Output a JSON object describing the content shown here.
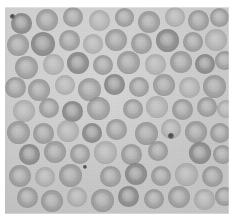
{
  "image": {
    "kind": "light-microscopy-photomicrograph",
    "subject": "red blood cells (erythrocytes) on a peripheral blood smear",
    "modality": "brightfield",
    "color_mode": "grayscale",
    "width_px": 234,
    "height_px": 224,
    "margin": {
      "paper_color": "#ffffff",
      "left_px": 5,
      "top_px": 7,
      "right_px": 5,
      "bottom_px": 10
    },
    "plate": {
      "left_px": 5,
      "top_px": 7,
      "width_px": 224,
      "height_px": 207,
      "background_color": "#c9c9c9",
      "background_label": "plasma / slide background"
    },
    "palette": {
      "background": "#c9c9c9",
      "background_light": "#cfcfcf",
      "background_dark": "#c2c2c2",
      "cell_rim": "#8e8e8e",
      "cell_body": "#a4a4a4",
      "cell_center_pallor": "#bdbdbd",
      "debris": "#4a4a4a",
      "paper": "#ffffff"
    },
    "cell_stats": {
      "count": 78,
      "mean_diameter_px": 20,
      "min_diameter_px": 15,
      "max_diameter_px": 25,
      "morphology": "biconcave discs with central pallor",
      "overlap_present": true
    },
    "debris_stats": {
      "count": 3,
      "description": "small dark punctate particles (platelet / stain precipitate)"
    }
  },
  "cells": [
    {
      "x": 6,
      "y": 6,
      "d": 21,
      "tone": "dark"
    },
    {
      "x": 31,
      "y": 2,
      "d": 22,
      "tone": "normal"
    },
    {
      "x": 58,
      "y": 0,
      "d": 20,
      "tone": "normal"
    },
    {
      "x": 84,
      "y": 3,
      "d": 21,
      "tone": "pale"
    },
    {
      "x": 110,
      "y": 1,
      "d": 19,
      "tone": "normal"
    },
    {
      "x": 133,
      "y": 4,
      "d": 22,
      "tone": "normal"
    },
    {
      "x": 160,
      "y": 0,
      "d": 20,
      "tone": "pale"
    },
    {
      "x": 183,
      "y": 3,
      "d": 21,
      "tone": "normal"
    },
    {
      "x": 205,
      "y": 1,
      "d": 19,
      "tone": "normal"
    },
    {
      "x": 2,
      "y": 27,
      "d": 22,
      "tone": "normal"
    },
    {
      "x": 26,
      "y": 25,
      "d": 24,
      "tone": "dark"
    },
    {
      "x": 54,
      "y": 23,
      "d": 21,
      "tone": "normal"
    },
    {
      "x": 78,
      "y": 27,
      "d": 20,
      "tone": "pale"
    },
    {
      "x": 100,
      "y": 22,
      "d": 22,
      "tone": "normal"
    },
    {
      "x": 126,
      "y": 26,
      "d": 21,
      "tone": "normal"
    },
    {
      "x": 151,
      "y": 22,
      "d": 23,
      "tone": "dark"
    },
    {
      "x": 178,
      "y": 25,
      "d": 20,
      "tone": "normal"
    },
    {
      "x": 200,
      "y": 22,
      "d": 22,
      "tone": "pale"
    },
    {
      "x": 10,
      "y": 49,
      "d": 23,
      "tone": "normal"
    },
    {
      "x": 38,
      "y": 47,
      "d": 21,
      "tone": "pale"
    },
    {
      "x": 62,
      "y": 45,
      "d": 22,
      "tone": "dark"
    },
    {
      "x": 88,
      "y": 48,
      "d": 20,
      "tone": "normal"
    },
    {
      "x": 112,
      "y": 44,
      "d": 23,
      "tone": "normal"
    },
    {
      "x": 140,
      "y": 47,
      "d": 21,
      "tone": "pale"
    },
    {
      "x": 165,
      "y": 44,
      "d": 22,
      "tone": "normal"
    },
    {
      "x": 190,
      "y": 47,
      "d": 20,
      "tone": "dark"
    },
    {
      "x": 210,
      "y": 44,
      "d": 19,
      "tone": "normal"
    },
    {
      "x": 0,
      "y": 70,
      "d": 21,
      "tone": "normal"
    },
    {
      "x": 23,
      "y": 72,
      "d": 22,
      "tone": "normal"
    },
    {
      "x": 50,
      "y": 68,
      "d": 20,
      "tone": "pale"
    },
    {
      "x": 73,
      "y": 71,
      "d": 23,
      "tone": "normal"
    },
    {
      "x": 99,
      "y": 67,
      "d": 21,
      "tone": "dark"
    },
    {
      "x": 124,
      "y": 70,
      "d": 20,
      "tone": "normal"
    },
    {
      "x": 148,
      "y": 67,
      "d": 22,
      "tone": "normal"
    },
    {
      "x": 174,
      "y": 70,
      "d": 21,
      "tone": "pale"
    },
    {
      "x": 198,
      "y": 68,
      "d": 23,
      "tone": "normal"
    },
    {
      "x": 8,
      "y": 93,
      "d": 22,
      "tone": "pale"
    },
    {
      "x": 34,
      "y": 91,
      "d": 20,
      "tone": "normal"
    },
    {
      "x": 57,
      "y": 94,
      "d": 21,
      "tone": "dark"
    },
    {
      "x": 82,
      "y": 90,
      "d": 23,
      "tone": "normal"
    },
    {
      "x": 118,
      "y": 92,
      "d": 20,
      "tone": "normal"
    },
    {
      "x": 141,
      "y": 89,
      "d": 22,
      "tone": "pale"
    },
    {
      "x": 167,
      "y": 92,
      "d": 21,
      "tone": "normal"
    },
    {
      "x": 192,
      "y": 90,
      "d": 20,
      "tone": "normal"
    },
    {
      "x": 212,
      "y": 93,
      "d": 18,
      "tone": "pale"
    },
    {
      "x": 2,
      "y": 114,
      "d": 23,
      "tone": "normal"
    },
    {
      "x": 28,
      "y": 116,
      "d": 21,
      "tone": "normal"
    },
    {
      "x": 52,
      "y": 113,
      "d": 22,
      "tone": "pale"
    },
    {
      "x": 77,
      "y": 116,
      "d": 20,
      "tone": "dark"
    },
    {
      "x": 101,
      "y": 112,
      "d": 21,
      "tone": "normal"
    },
    {
      "x": 130,
      "y": 115,
      "d": 23,
      "tone": "normal"
    },
    {
      "x": 156,
      "y": 112,
      "d": 20,
      "tone": "pale"
    },
    {
      "x": 180,
      "y": 114,
      "d": 22,
      "tone": "normal"
    },
    {
      "x": 205,
      "y": 116,
      "d": 20,
      "tone": "normal"
    },
    {
      "x": 14,
      "y": 137,
      "d": 21,
      "tone": "dark"
    },
    {
      "x": 39,
      "y": 134,
      "d": 22,
      "tone": "normal"
    },
    {
      "x": 65,
      "y": 137,
      "d": 20,
      "tone": "normal"
    },
    {
      "x": 89,
      "y": 134,
      "d": 23,
      "tone": "pale"
    },
    {
      "x": 116,
      "y": 137,
      "d": 21,
      "tone": "normal"
    },
    {
      "x": 143,
      "y": 134,
      "d": 20,
      "tone": "normal"
    },
    {
      "x": 184,
      "y": 135,
      "d": 22,
      "tone": "dark"
    },
    {
      "x": 208,
      "y": 138,
      "d": 19,
      "tone": "normal"
    },
    {
      "x": 4,
      "y": 158,
      "d": 22,
      "tone": "normal"
    },
    {
      "x": 30,
      "y": 160,
      "d": 20,
      "tone": "pale"
    },
    {
      "x": 54,
      "y": 157,
      "d": 23,
      "tone": "normal"
    },
    {
      "x": 95,
      "y": 159,
      "d": 21,
      "tone": "normal"
    },
    {
      "x": 120,
      "y": 156,
      "d": 22,
      "tone": "dark"
    },
    {
      "x": 146,
      "y": 159,
      "d": 20,
      "tone": "normal"
    },
    {
      "x": 170,
      "y": 156,
      "d": 23,
      "tone": "pale"
    },
    {
      "x": 197,
      "y": 159,
      "d": 21,
      "tone": "normal"
    },
    {
      "x": 12,
      "y": 180,
      "d": 21,
      "tone": "normal"
    },
    {
      "x": 36,
      "y": 183,
      "d": 22,
      "tone": "normal"
    },
    {
      "x": 62,
      "y": 180,
      "d": 20,
      "tone": "pale"
    },
    {
      "x": 86,
      "y": 182,
      "d": 23,
      "tone": "normal"
    },
    {
      "x": 113,
      "y": 179,
      "d": 21,
      "tone": "dark"
    },
    {
      "x": 139,
      "y": 182,
      "d": 20,
      "tone": "normal"
    },
    {
      "x": 163,
      "y": 179,
      "d": 22,
      "tone": "normal"
    },
    {
      "x": 189,
      "y": 182,
      "d": 21,
      "tone": "pale"
    },
    {
      "x": 210,
      "y": 180,
      "d": 19,
      "tone": "normal"
    }
  ],
  "debris": [
    {
      "x": 5,
      "y": 7,
      "d": 5,
      "label": "dark-particle-top-left"
    },
    {
      "x": 78,
      "y": 158,
      "d": 4,
      "label": "dark-particle-lower-left"
    },
    {
      "x": 163,
      "y": 126,
      "d": 6,
      "label": "dark-particle-center-right"
    }
  ]
}
